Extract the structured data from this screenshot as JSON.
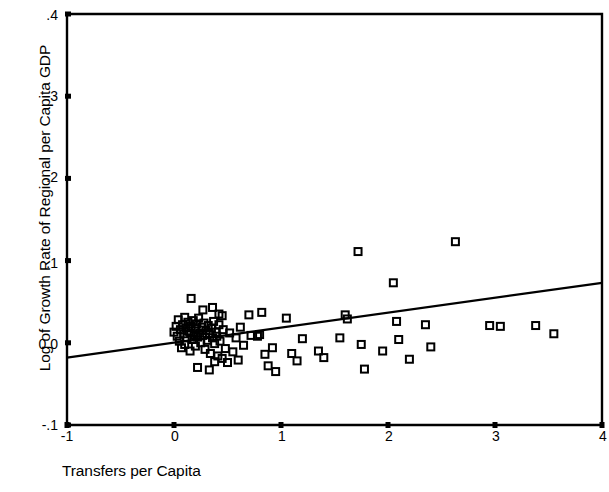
{
  "chart_data": {
    "type": "scatter",
    "title": "",
    "xlabel": "Transfers per Capita",
    "ylabel": "Log of Growth Rate of Regional per Capita GDP",
    "xlim": [
      -1,
      4
    ],
    "ylim": [
      -0.1,
      0.4
    ],
    "xticks": [
      -1,
      0,
      1,
      2,
      3,
      4
    ],
    "xtick_labels": [
      "-1",
      "0",
      "1",
      "2",
      "3",
      "4"
    ],
    "yticks": [
      -0.1,
      0.0,
      0.1,
      0.2,
      0.3,
      0.4
    ],
    "ytick_labels": [
      "-.1",
      "0.0",
      ".1",
      ".2",
      ".3",
      ".4"
    ],
    "grid": false,
    "legend": null,
    "marker": "open-square",
    "marker_color": "#000000",
    "line_color": "#000000",
    "series": [
      {
        "name": "observations",
        "marker": "open-square",
        "points": [
          [
            0.0,
            0.013
          ],
          [
            0.02,
            0.02
          ],
          [
            0.03,
            0.008
          ],
          [
            0.04,
            0.028
          ],
          [
            0.05,
            0.002
          ],
          [
            0.06,
            0.016
          ],
          [
            0.07,
            -0.006
          ],
          [
            0.08,
            0.022
          ],
          [
            0.09,
            0.011
          ],
          [
            0.1,
            0.031
          ],
          [
            0.1,
            -0.002
          ],
          [
            0.11,
            0.018
          ],
          [
            0.12,
            0.006
          ],
          [
            0.13,
            0.025
          ],
          [
            0.14,
            0.014
          ],
          [
            0.15,
            -0.01
          ],
          [
            0.16,
            0.02
          ],
          [
            0.17,
            0.004
          ],
          [
            0.18,
            0.027
          ],
          [
            0.19,
            0.01
          ],
          [
            0.2,
            0.017
          ],
          [
            0.2,
            -0.004
          ],
          [
            0.21,
            0.023
          ],
          [
            0.22,
            0.007
          ],
          [
            0.23,
            0.03
          ],
          [
            0.24,
            0.012
          ],
          [
            0.25,
            0.0
          ],
          [
            0.26,
            0.019
          ],
          [
            0.27,
            0.009
          ],
          [
            0.28,
            0.024
          ],
          [
            0.29,
            -0.008
          ],
          [
            0.3,
            0.015
          ],
          [
            0.31,
            0.003
          ],
          [
            0.32,
            0.021
          ],
          [
            0.33,
            0.011
          ],
          [
            0.34,
            -0.013
          ],
          [
            0.35,
            0.018
          ],
          [
            0.36,
            0.006
          ],
          [
            0.37,
            0.026
          ],
          [
            0.38,
            -0.001
          ],
          [
            0.39,
            0.013
          ],
          [
            0.4,
            0.008
          ],
          [
            0.41,
            -0.016
          ],
          [
            0.42,
            0.022
          ],
          [
            0.43,
            0.002
          ],
          [
            0.45,
            -0.019
          ],
          [
            0.46,
            0.016
          ],
          [
            0.48,
            -0.007
          ],
          [
            0.16,
            0.054
          ],
          [
            0.27,
            0.04
          ],
          [
            0.36,
            0.043
          ],
          [
            0.42,
            0.035
          ],
          [
            0.45,
            0.033
          ],
          [
            0.22,
            -0.03
          ],
          [
            0.33,
            -0.033
          ],
          [
            0.38,
            -0.023
          ],
          [
            0.5,
            -0.024
          ],
          [
            0.52,
            0.012
          ],
          [
            0.55,
            -0.011
          ],
          [
            0.58,
            0.006
          ],
          [
            0.6,
            -0.021
          ],
          [
            0.62,
            0.019
          ],
          [
            0.65,
            -0.003
          ],
          [
            0.7,
            0.034
          ],
          [
            0.72,
            0.009
          ],
          [
            0.78,
            0.008
          ],
          [
            0.8,
            0.01
          ],
          [
            0.82,
            0.037
          ],
          [
            0.85,
            -0.014
          ],
          [
            0.88,
            -0.028
          ],
          [
            0.92,
            -0.006
          ],
          [
            0.95,
            -0.035
          ],
          [
            1.05,
            0.03
          ],
          [
            1.1,
            -0.013
          ],
          [
            1.15,
            -0.022
          ],
          [
            1.2,
            0.005
          ],
          [
            1.35,
            -0.01
          ],
          [
            1.4,
            -0.018
          ],
          [
            1.55,
            0.006
          ],
          [
            1.6,
            0.034
          ],
          [
            1.62,
            0.029
          ],
          [
            1.72,
            0.111
          ],
          [
            1.75,
            -0.002
          ],
          [
            1.78,
            -0.032
          ],
          [
            1.95,
            -0.01
          ],
          [
            2.05,
            0.073
          ],
          [
            2.08,
            0.026
          ],
          [
            2.1,
            0.004
          ],
          [
            2.2,
            -0.02
          ],
          [
            2.35,
            0.022
          ],
          [
            2.4,
            -0.005
          ],
          [
            2.63,
            0.123
          ],
          [
            2.95,
            0.021
          ],
          [
            3.05,
            0.02
          ],
          [
            3.38,
            0.021
          ],
          [
            3.55,
            0.011
          ]
        ]
      }
    ],
    "fit_line": {
      "name": "regression-line",
      "x0": -1.0,
      "y0": -0.018,
      "x1": 4.0,
      "y1": 0.073
    }
  },
  "axes": {
    "x_title": "Transfers per Capita",
    "y_title": "Log of Growth Rate of Regional per Capita GDP"
  }
}
